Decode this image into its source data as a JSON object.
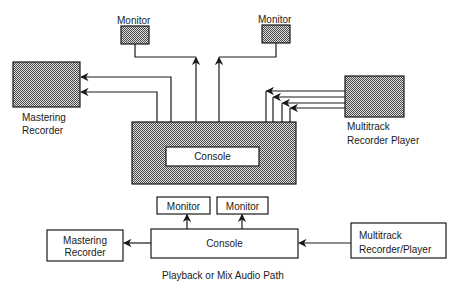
{
  "diagram": {
    "top": {
      "monitor_left": "Monitor",
      "monitor_right": "Monitor",
      "mastering_recorder": [
        "Mastering",
        "Recorder"
      ],
      "console": "Console",
      "multitrack": [
        "Multitrack",
        "Recorder Player"
      ]
    },
    "bottom": {
      "monitor_1": "Monitor",
      "monitor_2": "Monitor",
      "mastering_recorder": [
        "Mastering",
        "Recorder"
      ],
      "console": "Console",
      "multitrack": [
        "Multitrack",
        "Recorder/Player"
      ],
      "caption": "Playback or Mix Audio Path"
    },
    "colors": {
      "line": "#1a1a1a",
      "shade": "#9a9a9a",
      "background": "#ffffff"
    }
  }
}
